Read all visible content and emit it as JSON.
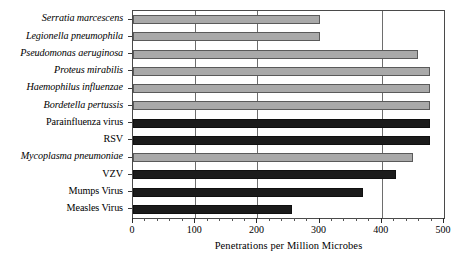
{
  "chart_data": {
    "type": "bar",
    "orientation": "horizontal",
    "title": "",
    "xlabel": "Penetrations per Million Microbes",
    "ylabel": "",
    "xlim": [
      0,
      500
    ],
    "ylim": null,
    "grid": true,
    "gridlines_x": [
      100,
      200,
      400
    ],
    "legend": null,
    "xticks": [
      0,
      100,
      200,
      300,
      400,
      500
    ],
    "xtick_labels": [
      "0",
      "100",
      "200",
      "300",
      "400",
      "500"
    ],
    "categories": [
      "Serratia marcescens",
      "Legionella pneumophila",
      "Pseudomonas aeruginosa",
      "Proteus mirabilis",
      "Haemophilus influenzae",
      "Bordetella pertussis",
      "Parainfluenza virus",
      "RSV",
      "Mycoplasma pneumoniae",
      "VZV",
      "Mumps Virus",
      "Measles Virus"
    ],
    "values": [
      300,
      300,
      458,
      478,
      478,
      478,
      478,
      478,
      450,
      423,
      370,
      255
    ],
    "bar_styles": [
      "gray",
      "gray",
      "gray",
      "gray",
      "gray",
      "gray",
      "black",
      "black",
      "gray",
      "black",
      "black",
      "black"
    ],
    "label_styles": [
      "italic",
      "italic",
      "italic",
      "italic",
      "italic",
      "italic",
      "roman",
      "roman",
      "italic",
      "roman",
      "roman",
      "roman"
    ],
    "colors": {
      "bar_gray_fill": "#a9a9a9",
      "bar_gray_edge": "#5a5a5a",
      "bar_black_fill": "#1b1b1b",
      "bar_black_edge": "#101010",
      "gridline": "#6e6e6e",
      "frame": "#4a4a4a",
      "text": "#000000",
      "background": "#ffffff"
    }
  }
}
